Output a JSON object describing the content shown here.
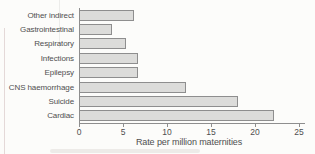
{
  "chart_data": {
    "type": "bar",
    "orientation": "horizontal",
    "title": "",
    "xlabel": "Rate per million maternities",
    "ylabel": "",
    "categories": [
      "Other indirect",
      "Gastrointestinal",
      "Respiratory",
      "Infections",
      "Epilepsy",
      "CNS haemorrhage",
      "Suicide",
      "Cardiac"
    ],
    "values": [
      6.3,
      3.8,
      5.3,
      6.7,
      6.7,
      12.2,
      18.1,
      22.1
    ],
    "xlim": [
      0,
      25
    ],
    "x_ticks": [
      0,
      5,
      10,
      15,
      20,
      25
    ],
    "grid": false,
    "legend": false,
    "colors": {
      "bar_fill": "#dcdcda",
      "bar_border": "#8e8e8e",
      "axis": "#8e8e8e",
      "text": "#4f4f4f",
      "background": "#fcfcfa"
    }
  }
}
